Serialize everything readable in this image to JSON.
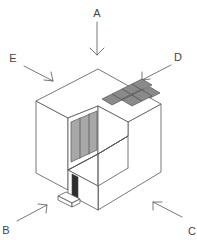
{
  "diagram": {
    "type": "isometric-cube-viewpoints",
    "labels": {
      "A": "A",
      "B": "B",
      "C": "C",
      "D": "D",
      "E": "E"
    },
    "arrows": [
      {
        "label": "A",
        "direction": "down",
        "points_to": "top"
      },
      {
        "label": "B",
        "direction": "up-right",
        "points_to": "front-left"
      },
      {
        "label": "C",
        "direction": "up-left",
        "points_to": "front-right"
      },
      {
        "label": "D",
        "direction": "down-left",
        "points_to": "back-right"
      },
      {
        "label": "E",
        "direction": "down-right",
        "points_to": "back-left"
      }
    ],
    "object": {
      "shape": "cube with cut-out corner recess",
      "features": [
        "3x3 tiled grid on top surface",
        "striped gray wall panel",
        "dark slot opening",
        "small step block at base"
      ]
    },
    "colors": {
      "line": "#555555",
      "tile": "#8a8a8a",
      "panel": "#a8a8a8",
      "slot": "#2e2e2e",
      "background": "#ffffff"
    }
  }
}
